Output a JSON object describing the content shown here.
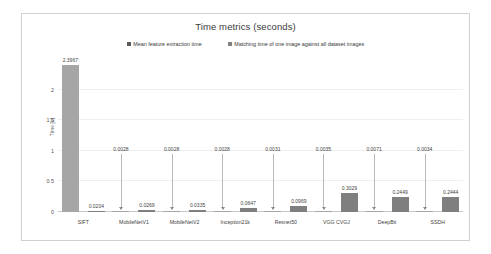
{
  "chart": {
    "title": "Time metrics (seconds)",
    "ylabel": "Time [s]",
    "legend": [
      {
        "label": "Mean feature extraction time",
        "color": "#a6a6a6"
      },
      {
        "label": "Matching time of one image against all dataset images",
        "color": "#7f7f7f"
      }
    ],
    "yticks": [
      "0",
      "0.5",
      "1",
      "1.5",
      "2"
    ]
  },
  "chart_data": {
    "type": "bar",
    "title": "Time metrics (seconds)",
    "xlabel": "",
    "ylabel": "Time [s]",
    "ylim": [
      0,
      2.5
    ],
    "yticks": [
      0,
      0.5,
      1,
      1.5,
      2
    ],
    "grid": true,
    "legend_position": "top",
    "categories": [
      "SIFT",
      "MobileNetV1",
      "MobileNetV2",
      "Inception21k",
      "Resnet50",
      "VGG CVGJ",
      "DeepBit",
      "SSDH"
    ],
    "series": [
      {
        "name": "Mean feature extraction time",
        "color": "#a6a6a6",
        "values": [
          2.3967,
          0.0028,
          0.0028,
          0.0028,
          0.0031,
          0.0035,
          0.0071,
          0.0034
        ],
        "labels": [
          "2.3967",
          "0.0028",
          "0.0028",
          "0.0028",
          "0.0031",
          "0.0035",
          "0.0071",
          "0.0034"
        ]
      },
      {
        "name": "Matching time of one image against all dataset images",
        "color": "#7f7f7f",
        "values": [
          0.0204,
          0.0269,
          0.0335,
          0.0647,
          0.0969,
          0.3029,
          0.2449,
          0.2444
        ],
        "labels": [
          "0.0204",
          "0.0269",
          "0.0335",
          "0.0647",
          "0.0969",
          "0.3029",
          "0.2449",
          "0.2444"
        ]
      }
    ]
  }
}
